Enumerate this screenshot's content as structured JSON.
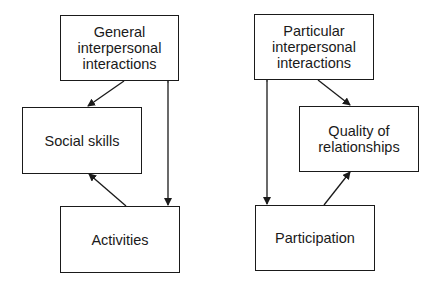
{
  "nodes": {
    "general": {
      "label": "General\ninterpersonal\ninteractions"
    },
    "social_skills": {
      "label": "Social skills"
    },
    "activities": {
      "label": "Activities"
    },
    "particular": {
      "label": "Particular\ninterpersonal\ninteractions"
    },
    "quality": {
      "label": "Quality of\nrelationships"
    },
    "participation": {
      "label": "Participation"
    }
  },
  "edges": [
    {
      "from": "general",
      "to": "social_skills",
      "type": "directed"
    },
    {
      "from": "activities",
      "to": "social_skills",
      "type": "directed"
    },
    {
      "from": "general",
      "to": "activities",
      "type": "bidirectional"
    },
    {
      "from": "particular",
      "to": "quality",
      "type": "directed"
    },
    {
      "from": "participation",
      "to": "quality",
      "type": "directed"
    },
    {
      "from": "particular",
      "to": "participation",
      "type": "bidirectional"
    }
  ],
  "colors": {
    "stroke": "#1a1a1a",
    "background": "#ffffff"
  }
}
